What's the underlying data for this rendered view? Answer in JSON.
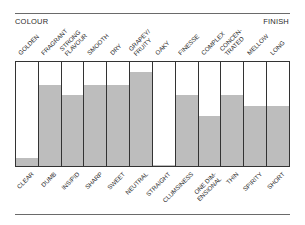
{
  "header": {
    "left": "COLOUR",
    "right": "FINISH"
  },
  "chart_data": {
    "type": "bar",
    "title": "",
    "categories_top": [
      "GOLDEN",
      "FRAGRANT",
      "STRONG FLAVOUR",
      "SMOOTH",
      "DRY",
      "GRAPEY/ FRUITY",
      "OAKY",
      "FINESSE",
      "COMPLEX",
      "CONCEN- TRATED",
      "MELLOW",
      "LONG"
    ],
    "categories_bottom": [
      "CLEAR",
      "DUMB",
      "INSIPID",
      "SHARP",
      "SWEET",
      "NEUTRAL",
      "STRAIGHT",
      "CLUMSINESS",
      "ONE DIM- ENSIONAL",
      "THIN",
      "SPIRITY",
      "SHORT"
    ],
    "values": [
      8,
      78,
      68,
      78,
      78,
      90,
      1,
      68,
      48,
      68,
      58,
      58
    ],
    "ylim": [
      0,
      100
    ],
    "xlabel": "",
    "ylabel": "",
    "grid": false,
    "fill_color": "#bdbdbd",
    "header_left": "COLOUR",
    "header_right": "FINISH"
  },
  "columns": [
    {
      "top": "GOLDEN",
      "bottom": "CLEAR",
      "fill": "8%"
    },
    {
      "top": "FRAGRANT",
      "bottom": "DUMB",
      "fill": "78%"
    },
    {
      "top": "STRONG\nFLAVOUR",
      "bottom": "INSIPID",
      "fill": "68%"
    },
    {
      "top": "SMOOTH",
      "bottom": "SHARP",
      "fill": "78%"
    },
    {
      "top": "DRY",
      "bottom": "SWEET",
      "fill": "78%"
    },
    {
      "top": "GRAPEY/\nFRUITY",
      "bottom": "NEUTRAL",
      "fill": "90%"
    },
    {
      "top": "OAKY",
      "bottom": "STRAIGHT",
      "fill": "1%"
    },
    {
      "top": "FINESSE",
      "bottom": "CLUMSINESS",
      "fill": "68%"
    },
    {
      "top": "COMPLEX",
      "bottom": "ONE DIM-\nENSIONAL",
      "fill": "48%"
    },
    {
      "top": "CONCEN-\nTRATED",
      "bottom": "THIN",
      "fill": "68%"
    },
    {
      "top": "MELLOW",
      "bottom": "SPIRITY",
      "fill": "58%"
    },
    {
      "top": "LONG",
      "bottom": "SHORT",
      "fill": "58%"
    }
  ]
}
